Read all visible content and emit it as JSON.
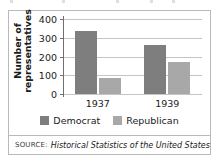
{
  "chart_data": {
    "type": "bar",
    "title": "",
    "xlabel": "",
    "ylabel": "Number of representatives",
    "categories": [
      "1937",
      "1939"
    ],
    "series": [
      {
        "name": "Democrat",
        "values": [
          334,
          262
        ],
        "color": "#7e7e7e"
      },
      {
        "name": "Republican",
        "values": [
          88,
          169
        ],
        "color": "#a8a8a8"
      }
    ],
    "ylim": [
      0,
      400
    ],
    "yticks": [
      0,
      100,
      200,
      300,
      400
    ],
    "ytick_labels": [
      "0",
      "100",
      "200",
      "300",
      "400"
    ],
    "grid": true,
    "legend_position": "bottom"
  },
  "source": {
    "label": "SOURCE:",
    "text": "Historical Statistics of the United States"
  }
}
